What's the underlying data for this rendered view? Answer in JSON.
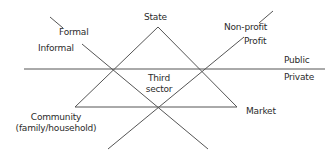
{
  "diagram": {
    "type": "welfare-triangle",
    "labels": {
      "state": "State",
      "market": "Market",
      "community_line1": "Community",
      "community_line2": "(family/household)",
      "third_sector_line1": "Third",
      "third_sector_line2": "sector",
      "formal": "Formal",
      "informal": "Informal",
      "non_profit": "Non-profit",
      "profit": "Profit",
      "public": "Public",
      "private": "Private"
    },
    "colors": {
      "line": "#555555",
      "text": "#2b2b2b",
      "background": "#ffffff"
    }
  }
}
